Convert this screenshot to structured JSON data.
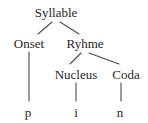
{
  "figure": {
    "kind": "syllable-structure-tree",
    "background_color": "#ffffff",
    "stroke_color": "#4a4a4a",
    "text_color": "#282527"
  },
  "nodes": {
    "syllable": "Syllable",
    "onset": "Onset",
    "ryhme": "Ryhme",
    "nucleus": "Nucleus",
    "coda": "Coda"
  },
  "leaves": {
    "onset_segment": "p",
    "nucleus_segment": "i",
    "coda_segment": "n"
  }
}
